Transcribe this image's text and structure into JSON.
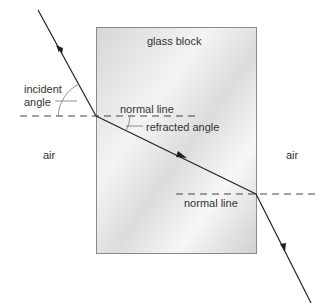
{
  "diagram": {
    "labels": {
      "glass_block": "glass block",
      "incident_angle_line1": "incident",
      "incident_angle_line2": "angle",
      "normal_line_1": "normal line",
      "refracted_angle": "refracted angle",
      "air_left": "air",
      "air_right": "air",
      "normal_line_2": "normal line"
    },
    "colors": {
      "ray": "#222222",
      "dashed_normal": "#444444",
      "block_border": "#8a8a8a",
      "block_fill_light": "#ffffff",
      "block_fill_dark": "#d8d8d8"
    }
  }
}
